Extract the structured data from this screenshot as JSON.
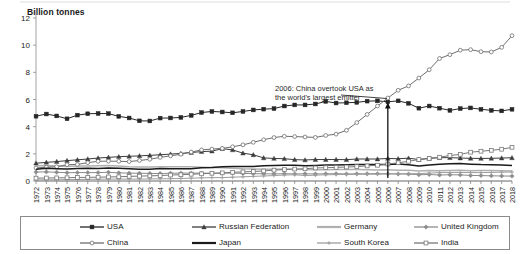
{
  "chart_data": {
    "type": "line",
    "title": "",
    "ylabel": "Billion tonnes",
    "xlabel": "",
    "ylim": [
      0,
      12
    ],
    "yticks": [
      0,
      2,
      4,
      6,
      8,
      10,
      12
    ],
    "grid": false,
    "legend_position": "bottom",
    "x": [
      1972,
      1973,
      1974,
      1975,
      1976,
      1977,
      1978,
      1979,
      1980,
      1981,
      1982,
      1983,
      1984,
      1985,
      1986,
      1987,
      1988,
      1989,
      1990,
      1991,
      1992,
      1993,
      1994,
      1995,
      1996,
      1997,
      1998,
      1999,
      2000,
      2001,
      2002,
      2003,
      2004,
      2005,
      2006,
      2007,
      2008,
      2009,
      2010,
      2011,
      2012,
      2013,
      2014,
      2015,
      2016,
      2017,
      2018
    ],
    "xtick_labels": [
      "1972",
      "1973",
      "1974",
      "1975",
      "1976",
      "1977",
      "1978",
      "1979",
      "1980",
      "1981",
      "1982",
      "1983",
      "1984",
      "1985",
      "1986",
      "1987",
      "1988",
      "1989",
      "1990",
      "1991",
      "1992",
      "1993",
      "1994",
      "1995",
      "1996",
      "1997",
      "1998",
      "1999",
      "2000",
      "2001",
      "2002",
      "2003",
      "2004",
      "2005",
      "2006",
      "2007",
      "2008",
      "2009",
      "2010",
      "2011",
      "2012",
      "2013",
      "2014",
      "2015",
      "2016",
      "2017",
      "2018"
    ],
    "series": [
      {
        "name": "USA",
        "color": "#262626",
        "marker": "square-filled",
        "values": [
          4.77,
          4.93,
          4.79,
          4.58,
          4.85,
          4.95,
          4.97,
          4.96,
          4.76,
          4.64,
          4.43,
          4.42,
          4.63,
          4.64,
          4.68,
          4.83,
          5.04,
          5.12,
          5.08,
          5.02,
          5.12,
          5.23,
          5.29,
          5.33,
          5.52,
          5.6,
          5.6,
          5.67,
          5.86,
          5.74,
          5.76,
          5.79,
          5.88,
          5.9,
          5.83,
          5.9,
          5.72,
          5.36,
          5.52,
          5.36,
          5.2,
          5.33,
          5.38,
          5.28,
          5.2,
          5.16,
          5.28
        ]
      },
      {
        "name": "Russian Federation",
        "color": "#3d3d3d",
        "marker": "triangle-filled",
        "values": [
          1.31,
          1.37,
          1.43,
          1.5,
          1.56,
          1.62,
          1.69,
          1.74,
          1.79,
          1.82,
          1.85,
          1.89,
          1.93,
          1.98,
          2.03,
          2.1,
          2.16,
          2.2,
          2.38,
          2.29,
          2.05,
          1.93,
          1.7,
          1.66,
          1.64,
          1.57,
          1.55,
          1.58,
          1.58,
          1.58,
          1.57,
          1.62,
          1.62,
          1.62,
          1.66,
          1.64,
          1.68,
          1.58,
          1.67,
          1.72,
          1.72,
          1.69,
          1.67,
          1.66,
          1.67,
          1.69,
          1.71
        ]
      },
      {
        "name": "Germany",
        "color": "#b0b0b0",
        "marker": "none",
        "values": [
          1.12,
          1.14,
          1.1,
          1.06,
          1.11,
          1.1,
          1.12,
          1.14,
          1.1,
          1.05,
          1.03,
          1.03,
          1.04,
          1.05,
          1.05,
          1.04,
          1.02,
          1.0,
          0.98,
          0.94,
          0.9,
          0.89,
          0.87,
          0.87,
          0.89,
          0.86,
          0.85,
          0.83,
          0.83,
          0.85,
          0.84,
          0.84,
          0.83,
          0.81,
          0.82,
          0.79,
          0.79,
          0.73,
          0.78,
          0.75,
          0.77,
          0.79,
          0.76,
          0.77,
          0.77,
          0.76,
          0.73
        ]
      },
      {
        "name": "United Kingdom",
        "color": "#8c8c8c",
        "marker": "diamond-filled",
        "values": [
          0.66,
          0.67,
          0.64,
          0.61,
          0.62,
          0.62,
          0.62,
          0.64,
          0.6,
          0.58,
          0.57,
          0.56,
          0.55,
          0.57,
          0.58,
          0.58,
          0.58,
          0.57,
          0.57,
          0.58,
          0.56,
          0.54,
          0.53,
          0.52,
          0.54,
          0.52,
          0.53,
          0.52,
          0.53,
          0.54,
          0.52,
          0.53,
          0.53,
          0.54,
          0.53,
          0.52,
          0.51,
          0.46,
          0.48,
          0.44,
          0.46,
          0.45,
          0.41,
          0.4,
          0.38,
          0.37,
          0.36
        ]
      },
      {
        "name": "China",
        "color": "#6e6e6e",
        "marker": "circle-open",
        "values": [
          0.96,
          1.02,
          1.05,
          1.2,
          1.22,
          1.35,
          1.45,
          1.46,
          1.45,
          1.43,
          1.51,
          1.6,
          1.74,
          1.85,
          1.97,
          2.13,
          2.29,
          2.35,
          2.4,
          2.52,
          2.66,
          2.85,
          3.04,
          3.2,
          3.29,
          3.27,
          3.24,
          3.21,
          3.35,
          3.45,
          3.73,
          4.3,
          4.9,
          5.52,
          6.11,
          6.68,
          7.0,
          7.58,
          8.19,
          9.02,
          9.3,
          9.63,
          9.67,
          9.52,
          9.5,
          9.84,
          10.7
        ]
      },
      {
        "name": "Japan",
        "color": "#1a1a1a",
        "marker": "none",
        "values": [
          0.87,
          0.93,
          0.91,
          0.88,
          0.92,
          0.94,
          0.92,
          0.96,
          0.93,
          0.9,
          0.87,
          0.87,
          0.92,
          0.91,
          0.9,
          0.9,
          0.97,
          1.0,
          1.05,
          1.06,
          1.07,
          1.07,
          1.13,
          1.15,
          1.16,
          1.16,
          1.12,
          1.15,
          1.18,
          1.17,
          1.2,
          1.21,
          1.22,
          1.22,
          1.21,
          1.25,
          1.2,
          1.11,
          1.17,
          1.24,
          1.27,
          1.28,
          1.24,
          1.21,
          1.2,
          1.18,
          1.15
        ]
      },
      {
        "name": "South Korea",
        "color": "#9e9e9e",
        "marker": "plus",
        "values": [
          0.08,
          0.09,
          0.09,
          0.1,
          0.11,
          0.12,
          0.13,
          0.14,
          0.14,
          0.14,
          0.14,
          0.15,
          0.16,
          0.17,
          0.19,
          0.21,
          0.23,
          0.25,
          0.25,
          0.28,
          0.31,
          0.34,
          0.37,
          0.4,
          0.44,
          0.46,
          0.4,
          0.43,
          0.46,
          0.47,
          0.48,
          0.49,
          0.5,
          0.5,
          0.52,
          0.53,
          0.54,
          0.54,
          0.58,
          0.62,
          0.62,
          0.63,
          0.62,
          0.62,
          0.63,
          0.65,
          0.66
        ]
      },
      {
        "name": "India",
        "color": "#787878",
        "marker": "square-open",
        "values": [
          0.21,
          0.22,
          0.23,
          0.24,
          0.26,
          0.27,
          0.28,
          0.3,
          0.31,
          0.34,
          0.36,
          0.38,
          0.4,
          0.44,
          0.46,
          0.5,
          0.53,
          0.57,
          0.6,
          0.64,
          0.67,
          0.7,
          0.74,
          0.8,
          0.84,
          0.88,
          0.9,
          0.96,
          0.98,
          1.0,
          1.03,
          1.06,
          1.11,
          1.16,
          1.25,
          1.34,
          1.45,
          1.58,
          1.66,
          1.75,
          1.88,
          1.96,
          2.12,
          2.19,
          2.26,
          2.34,
          2.48
        ]
      }
    ],
    "annotations": [
      {
        "name": "china-overtook-usa",
        "line1": "2006: China overtook USA as",
        "line2": "the world's largest emitter",
        "target_year": 2006,
        "target_value": 6.0
      }
    ]
  },
  "legend": {
    "rows": [
      [
        {
          "label": "USA",
          "marker": "square-filled",
          "color": "#262626"
        },
        {
          "label": "Russian Federation",
          "marker": "triangle-filled",
          "color": "#3d3d3d"
        },
        {
          "label": "Germany",
          "marker": "none",
          "color": "#b0b0b0"
        },
        {
          "label": "United Kingdom",
          "marker": "diamond-filled",
          "color": "#8c8c8c"
        }
      ],
      [
        {
          "label": "China",
          "marker": "circle-open",
          "color": "#6e6e6e"
        },
        {
          "label": "Japan",
          "marker": "none",
          "color": "#1a1a1a"
        },
        {
          "label": "South Korea",
          "marker": "plus",
          "color": "#9e9e9e"
        },
        {
          "label": "India",
          "marker": "square-open",
          "color": "#787878"
        }
      ]
    ]
  }
}
